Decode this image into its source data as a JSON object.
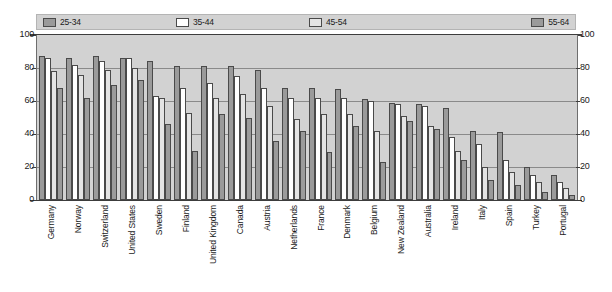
{
  "legend": {
    "items": [
      {
        "label": "25-34",
        "color": "#9a9a9a",
        "swatch": "legend-swatch-25-34"
      },
      {
        "label": "35-44",
        "color": "#ffffff",
        "swatch": "legend-swatch-35-44"
      },
      {
        "label": "45-54",
        "color": "#e4e4e4",
        "swatch": "legend-swatch-45-54"
      },
      {
        "label": "55-64",
        "color": "#9a9a9a",
        "swatch": "legend-swatch-55-64"
      }
    ]
  },
  "axis": {
    "left_ticks": [
      "100",
      "80",
      "60",
      "40",
      "20",
      "0"
    ],
    "right_ticks": [
      "100",
      "80",
      "60",
      "40",
      "20",
      "0"
    ]
  },
  "chart_data": {
    "type": "bar",
    "title": "",
    "subtitle": "",
    "xlabel": "",
    "ylabel": "",
    "ylim": [
      0,
      100
    ],
    "yticks": [
      0,
      20,
      40,
      60,
      80,
      100
    ],
    "grid": true,
    "legend_position": "top",
    "categories": [
      "Germany",
      "Norway",
      "Switzerland",
      "United States",
      "Sweden",
      "Finland",
      "United Kingdom",
      "Canada",
      "Austria",
      "Netherlands",
      "France",
      "Denmark",
      "Belgium",
      "New Zealand",
      "Australia",
      "Ireland",
      "Italy",
      "Spain",
      "Turkey",
      "Portugal"
    ],
    "series": [
      {
        "name": "25-34",
        "color": "#9a9a9a",
        "values": [
          87,
          86,
          87,
          86,
          84,
          81,
          81,
          81,
          79,
          68,
          68,
          67,
          61,
          59,
          58,
          56,
          42,
          41,
          20,
          15
        ]
      },
      {
        "name": "35-44",
        "color": "#ffffff",
        "values": [
          86,
          82,
          84,
          86,
          63,
          68,
          71,
          75,
          68,
          62,
          62,
          62,
          60,
          58,
          57,
          38,
          34,
          24,
          15,
          11
        ]
      },
      {
        "name": "45-54",
        "color": "#e4e4e4",
        "values": [
          78,
          76,
          79,
          80,
          62,
          53,
          62,
          64,
          57,
          49,
          52,
          52,
          42,
          51,
          45,
          30,
          20,
          17,
          11,
          7
        ]
      },
      {
        "name": "55-64",
        "color": "#9a9a9a",
        "values": [
          68,
          62,
          70,
          73,
          46,
          30,
          52,
          50,
          36,
          42,
          29,
          45,
          23,
          48,
          43,
          24,
          12,
          9,
          5,
          3
        ]
      }
    ]
  }
}
